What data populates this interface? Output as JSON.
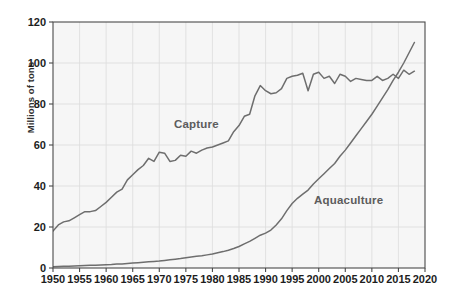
{
  "chart_data": {
    "type": "line",
    "title": "",
    "subtitle": "",
    "xlabel": "",
    "ylabel": "Millions of tons",
    "xlim": [
      1950,
      2020
    ],
    "ylim": [
      0,
      120
    ],
    "grid": true,
    "legend_position": "inline-annotation",
    "x_ticks": [
      1950,
      1955,
      1960,
      1965,
      1970,
      1975,
      1980,
      1985,
      1990,
      1995,
      2000,
      2005,
      2010,
      2015,
      2020
    ],
    "y_ticks": [
      0,
      20,
      40,
      60,
      80,
      100,
      120
    ],
    "annotations": [
      {
        "text": "Capture",
        "x": 1972,
        "y": 70
      },
      {
        "text": "Aquaculture",
        "x": 2001,
        "y": 38
      }
    ],
    "colors": {
      "capture_line": "#6e6e6e",
      "aquaculture_line": "#6e6e6e",
      "plot_background": "#f6f6f6",
      "grid": "#dcdcdc",
      "axis": "#4a4a4a",
      "tick_text": "#1d1d1d",
      "annotation_text": "#5c5c5c"
    },
    "x": [
      1950,
      1951,
      1952,
      1953,
      1954,
      1955,
      1956,
      1957,
      1958,
      1959,
      1960,
      1961,
      1962,
      1963,
      1964,
      1965,
      1966,
      1967,
      1968,
      1969,
      1970,
      1971,
      1972,
      1973,
      1974,
      1975,
      1976,
      1977,
      1978,
      1979,
      1980,
      1981,
      1982,
      1983,
      1984,
      1985,
      1986,
      1987,
      1988,
      1989,
      1990,
      1991,
      1992,
      1993,
      1994,
      1995,
      1996,
      1997,
      1998,
      1999,
      2000,
      2001,
      2002,
      2003,
      2004,
      2005,
      2006,
      2007,
      2008,
      2009,
      2010,
      2011,
      2012,
      2013,
      2014,
      2015,
      2016,
      2017,
      2018
    ],
    "series": [
      {
        "name": "Capture",
        "values": [
          18.0,
          21.0,
          22.5,
          23.0,
          24.5,
          26.0,
          27.5,
          27.5,
          28.0,
          30.0,
          32.0,
          34.5,
          37.0,
          38.5,
          43.0,
          45.5,
          48.0,
          50.0,
          53.5,
          52.0,
          56.5,
          56.0,
          52.0,
          52.5,
          55.0,
          54.5,
          57.0,
          56.0,
          57.5,
          58.5,
          59.0,
          60.0,
          61.0,
          62.0,
          66.5,
          69.5,
          74.0,
          75.0,
          84.0,
          89.0,
          86.5,
          85.0,
          85.5,
          87.5,
          92.5,
          93.5,
          94.0,
          95.0,
          86.5,
          94.5,
          95.5,
          92.5,
          93.5,
          90.0,
          94.5,
          93.5,
          91.0,
          92.5,
          92.0,
          91.5,
          91.5,
          93.5,
          91.5,
          92.5,
          94.5,
          92.5,
          96.5,
          94.5,
          96.0
        ],
        "color": "#6e6e6e"
      },
      {
        "name": "Aquaculture",
        "values": [
          0.6,
          0.7,
          0.8,
          0.9,
          1.0,
          1.1,
          1.2,
          1.3,
          1.4,
          1.5,
          1.6,
          1.7,
          1.9,
          2.0,
          2.2,
          2.4,
          2.6,
          2.8,
          3.0,
          3.2,
          3.4,
          3.7,
          4.0,
          4.3,
          4.6,
          5.0,
          5.4,
          5.7,
          6.0,
          6.4,
          6.8,
          7.4,
          8.0,
          8.7,
          9.5,
          10.5,
          11.8,
          13.0,
          14.5,
          16.0,
          17.0,
          18.5,
          21.0,
          24.0,
          28.0,
          31.5,
          34.0,
          36.0,
          38.0,
          41.0,
          43.5,
          46.0,
          48.5,
          51.0,
          54.5,
          57.5,
          61.0,
          64.5,
          68.0,
          71.5,
          75.0,
          79.0,
          83.0,
          87.0,
          91.5,
          95.5,
          100.0,
          105.0,
          110.0
        ],
        "color": "#6e6e6e"
      }
    ]
  },
  "axis": {
    "y_title": "Millions of tons",
    "y_tick_labels": [
      "120",
      "100",
      "80",
      "60",
      "40",
      "20",
      "0"
    ],
    "x_tick_labels": [
      "1950",
      "1955",
      "1960",
      "1965",
      "1970",
      "1975",
      "1980",
      "1985",
      "1990",
      "1995",
      "2000",
      "2005",
      "2010",
      "2015",
      "2020"
    ]
  },
  "annotations": {
    "capture": "Capture",
    "aquaculture": "Aquaculture"
  }
}
